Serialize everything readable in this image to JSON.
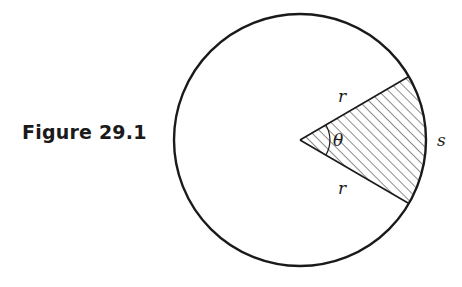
{
  "figure": {
    "caption": "Figure 29.1",
    "labels": {
      "radius_top": "r",
      "radius_bottom": "r",
      "angle": "θ",
      "arc": "s"
    },
    "colors": {
      "stroke": "#1a1a1a",
      "background": "#ffffff"
    }
  }
}
